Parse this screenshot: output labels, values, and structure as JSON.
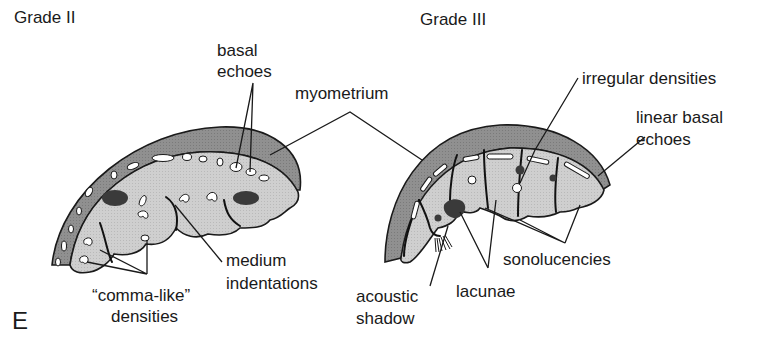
{
  "figure": {
    "panel_letter": "E",
    "colors": {
      "myometrium": "#8e8e8e",
      "placenta": "#cdcdcd",
      "dense": "#3a3a3a",
      "echo": "#ffffff",
      "ink": "#1a1a1a"
    },
    "grade2": {
      "title": "Grade II",
      "labels": {
        "basal_echoes_1": "basal",
        "basal_echoes_2": "echoes",
        "myometrium": "myometrium",
        "medium_indent_1": "medium",
        "medium_indent_2": "indentations",
        "comma_1": "“comma-like”",
        "comma_2": "densities"
      }
    },
    "grade3": {
      "title": "Grade III",
      "labels": {
        "irregular_densities": "irregular densities",
        "linear_basal_1": "linear basal",
        "linear_basal_2": "echoes",
        "sonolucencies": "sonolucencies",
        "lacunae": "lacunae",
        "acoustic_1": "acoustic",
        "acoustic_2": "shadow"
      }
    }
  }
}
